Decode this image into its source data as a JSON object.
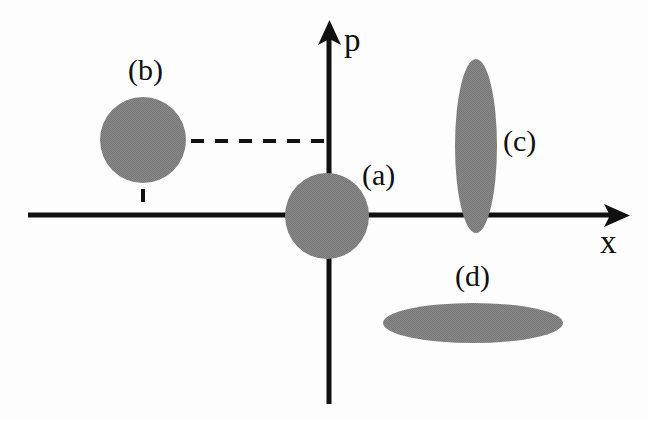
{
  "figure": {
    "title": "",
    "background_color": "#fdfdfd",
    "shape_fill_color": "#808080",
    "axis_color": "#111111"
  },
  "axes": {
    "x_axis": {
      "label": "x",
      "label_x": 600,
      "label_y": 226,
      "line_y": 215,
      "line_x_start": 28,
      "line_x_end": 624,
      "arrow": "right-arrow-head"
    },
    "y_axis": {
      "label": "p",
      "label_x": 344,
      "label_y": 24,
      "line_x": 329,
      "line_y_start": 22,
      "line_y_end": 404,
      "arrow": "up-arrow-head"
    }
  },
  "guides": {
    "horizontal_dashed": {
      "x1": 143,
      "y1": 141,
      "x2": 330,
      "y2": 141
    },
    "vertical_dashed": {
      "x1": 143,
      "y1": 141,
      "x2": 143,
      "y2": 216
    }
  },
  "chart_data": {
    "type": "scatter",
    "title": "",
    "xlabel": "x",
    "ylabel": "p",
    "grid": false,
    "legend": "inline-annotations",
    "blobs": [
      {
        "label": "(a)",
        "center_x": 327,
        "center_y": 216,
        "rx": 42,
        "ry": 43,
        "rotation": 0,
        "label_x": 362,
        "label_y": 160,
        "kind": "coherent-state-at-origin"
      },
      {
        "label": "(b)",
        "center_x": 143,
        "center_y": 140,
        "rx": 43,
        "ry": 43,
        "rotation": 0,
        "label_x": 128,
        "label_y": 55,
        "kind": "displaced-coherent-state"
      },
      {
        "label": "(c)",
        "center_x": 476,
        "center_y": 146,
        "rx": 21,
        "ry": 87,
        "rotation": 0,
        "label_x": 503,
        "label_y": 126,
        "kind": "momentum-squeezed-state"
      },
      {
        "label": "(d)",
        "center_x": 473,
        "center_y": 323,
        "rx": 90,
        "ry": 20,
        "rotation": 0,
        "label_x": 455,
        "label_y": 261,
        "kind": "position-squeezed-state"
      }
    ]
  }
}
